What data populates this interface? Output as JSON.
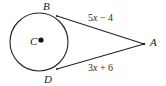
{
  "figure": {
    "type": "circle-with-two-tangents",
    "background_color": "#ffffff",
    "stroke_color": "#222222",
    "text_color": "#2b2b2b",
    "points": {
      "center": {
        "label": "C",
        "x": 39,
        "y": 42
      },
      "tangent_top": {
        "label": "B",
        "x": 57,
        "y": 16
      },
      "tangent_bottom": {
        "label": "D",
        "x": 57,
        "y": 69
      },
      "apex": {
        "label": "A",
        "x": 144,
        "y": 44
      }
    },
    "circle": {
      "cx": 39,
      "cy": 42,
      "r": 29
    },
    "segments": [
      {
        "name": "BA",
        "from": "B",
        "to": "A",
        "expression": "5x − 4",
        "coefficient": "5",
        "variable": "x",
        "operator": "−",
        "constant": "4"
      },
      {
        "name": "DA",
        "from": "D",
        "to": "A",
        "expression": "3x + 6",
        "coefficient": "3",
        "variable": "x",
        "operator": "+",
        "constant": "6"
      }
    ]
  }
}
